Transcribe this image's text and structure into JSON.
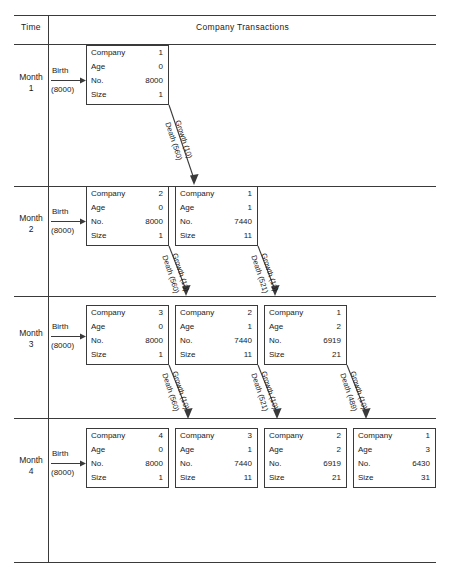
{
  "header": {
    "time_label": "Time",
    "transactions_label": "Company Transactions"
  },
  "birth": {
    "word": "Birth",
    "amount": "(8000)"
  },
  "box_fields": {
    "company": "Company",
    "age": "Age",
    "no": "No.",
    "size": "Size"
  },
  "rows": [
    {
      "month_word": "Month",
      "month_num": "1",
      "boxes": [
        {
          "company": "1",
          "age": "0",
          "no": "8000",
          "size": "1"
        }
      ],
      "transitions": [
        {
          "growth": "Growth (10)",
          "death": "Death (560)"
        }
      ]
    },
    {
      "month_word": "Month",
      "month_num": "2",
      "boxes": [
        {
          "company": "2",
          "age": "0",
          "no": "8000",
          "size": "1"
        },
        {
          "company": "1",
          "age": "1",
          "no": "7440",
          "size": "11"
        }
      ],
      "transitions": [
        {
          "growth": "Growth (10)",
          "death": "Death (560)"
        },
        {
          "growth": "Growth (10)",
          "death": "Death (521)"
        }
      ]
    },
    {
      "month_word": "Month",
      "month_num": "3",
      "boxes": [
        {
          "company": "3",
          "age": "0",
          "no": "8000",
          "size": "1"
        },
        {
          "company": "2",
          "age": "1",
          "no": "7440",
          "size": "11"
        },
        {
          "company": "1",
          "age": "2",
          "no": "6919",
          "size": "21"
        }
      ],
      "transitions": [
        {
          "growth": "Growth (10)",
          "death": "Death (560)"
        },
        {
          "growth": "Growth (10)",
          "death": "Death (521)"
        },
        {
          "growth": "Growth (10)",
          "death": "Death (489)"
        }
      ]
    },
    {
      "month_word": "Month",
      "month_num": "4",
      "boxes": [
        {
          "company": "4",
          "age": "0",
          "no": "8000",
          "size": "1"
        },
        {
          "company": "3",
          "age": "1",
          "no": "7440",
          "size": "11"
        },
        {
          "company": "2",
          "age": "2",
          "no": "6919",
          "size": "21"
        },
        {
          "company": "1",
          "age": "3",
          "no": "6430",
          "size": "31"
        }
      ],
      "transitions": []
    }
  ],
  "colors": {
    "line": "#3a3a3a",
    "text": "#1a1a1a",
    "background": "#ffffff"
  }
}
